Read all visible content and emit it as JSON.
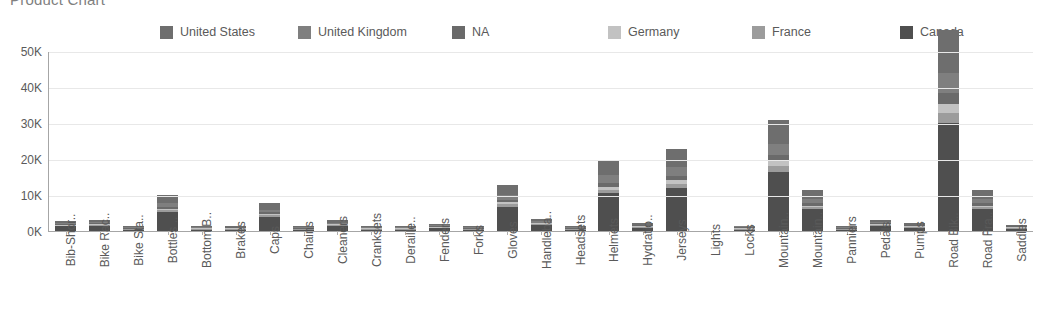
{
  "title": "Product Chart",
  "legend": {
    "position": "top",
    "items": [
      {
        "label": "United States",
        "color": "#6e6e6e"
      },
      {
        "label": "United Kingdom",
        "color": "#7f7f7f"
      },
      {
        "label": "NA",
        "color": "#6a6a6a"
      },
      {
        "label": "Germany",
        "color": "#c2c2c2"
      },
      {
        "label": "France",
        "color": "#9c9c9c"
      },
      {
        "label": "Canada",
        "color": "#4f4f4f"
      }
    ]
  },
  "y_axis": {
    "ticks": [
      "50K",
      "40K",
      "30K",
      "20K",
      "10K",
      "0K"
    ],
    "min": 0,
    "max": 50000
  },
  "chart_data": {
    "type": "bar",
    "subtype": "stacked-column",
    "title": "Product Chart",
    "xlabel": "",
    "ylabel": "",
    "ylim": [
      0,
      50000
    ],
    "ytick_labels": [
      "0K",
      "10K",
      "20K",
      "30K",
      "40K",
      "50K"
    ],
    "ytick_values": [
      0,
      10000,
      20000,
      30000,
      40000,
      50000
    ],
    "grid": true,
    "legend_position": "top",
    "categories": [
      "Bib-Shor..",
      "Bike Rac..",
      "Bike Sta..",
      "Bottles ..",
      "Bottom B..",
      "Brakes",
      "Caps",
      "Chains",
      "Cleaners",
      "Cranksets",
      "Deraille..",
      "Fenders",
      "Forks",
      "Gloves",
      "Handleba..",
      "Headsets",
      "Helmets",
      "Hydratio..",
      "Jerseys",
      "Lights",
      "Locks",
      "Mountain..",
      "Mountain..",
      "Panniers",
      "Pedals",
      "Pumps",
      "Road Bik..",
      "Road Fra..",
      "Saddles"
    ],
    "series": [
      {
        "name": "Canada",
        "color": "#4f4f4f",
        "values": [
          1300,
          1500,
          150,
          5200,
          300,
          320,
          4000,
          200,
          1400,
          260,
          300,
          700,
          200,
          6800,
          1700,
          220,
          10500,
          900,
          12000,
          0,
          400,
          16500,
          6000,
          60,
          1500,
          900,
          30000,
          6000,
          600
        ]
      },
      {
        "name": "France",
        "color": "#9c9c9c",
        "values": [
          120,
          140,
          10,
          500,
          30,
          30,
          380,
          20,
          130,
          25,
          30,
          70,
          20,
          620,
          160,
          20,
          950,
          85,
          1100,
          0,
          40,
          1500,
          550,
          5,
          140,
          85,
          2700,
          550,
          55
        ]
      },
      {
        "name": "Germany",
        "color": "#c2c2c2",
        "values": [
          110,
          130,
          10,
          460,
          28,
          28,
          350,
          18,
          120,
          23,
          28,
          65,
          18,
          570,
          150,
          18,
          880,
          78,
          1000,
          0,
          37,
          1380,
          510,
          5,
          130,
          78,
          2500,
          510,
          50
        ]
      },
      {
        "name": "NA",
        "color": "#6a6a6a",
        "values": [
          150,
          170,
          12,
          600,
          35,
          35,
          450,
          24,
          160,
          30,
          35,
          85,
          24,
          750,
          195,
          24,
          1150,
          100,
          1300,
          0,
          48,
          1800,
          660,
          6,
          170,
          100,
          3200,
          660,
          65
        ]
      },
      {
        "name": "United Kingdom",
        "color": "#7f7f7f",
        "values": [
          260,
          300,
          22,
          1050,
          60,
          62,
          780,
          42,
          280,
          52,
          60,
          150,
          42,
          1300,
          340,
          42,
          2000,
          175,
          2300,
          0,
          85,
          3100,
          1150,
          11,
          300,
          175,
          5500,
          1150,
          115
        ]
      },
      {
        "name": "United States",
        "color": "#6e6e6e",
        "values": [
          560,
          660,
          46,
          2300,
          130,
          135,
          1700,
          90,
          610,
          110,
          130,
          330,
          90,
          2800,
          740,
          90,
          4300,
          380,
          5000,
          0,
          180,
          6700,
          2500,
          23,
          660,
          380,
          12000,
          2500,
          250
        ]
      }
    ],
    "totals": [
      2500,
      2900,
      250,
      10110,
      583,
      610,
      7660,
      394,
      2700,
      500,
      583,
      1400,
      394,
      12840,
      3285,
      414,
      19780,
      1718,
      22700,
      0,
      790,
      30980,
      11370,
      110,
      2900,
      1718,
      55900,
      11370,
      1135
    ]
  }
}
